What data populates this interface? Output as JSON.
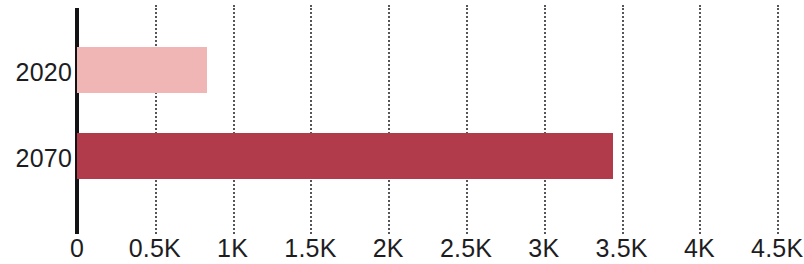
{
  "chart_data": {
    "type": "bar",
    "orientation": "horizontal",
    "title": "",
    "subtitle": "",
    "xlabel": "",
    "ylabel": "",
    "categories": [
      "2020",
      "2070"
    ],
    "values": [
      835,
      3445
    ],
    "series": [
      {
        "name": "",
        "values": [
          835,
          3445
        ],
        "colors": [
          "#f0b5b5",
          "#b23b4b"
        ]
      }
    ],
    "xlim": [
      0,
      4700
    ],
    "xticks": [
      0,
      500,
      1000,
      1500,
      2000,
      2500,
      3000,
      3500,
      4000,
      4500
    ],
    "xtick_labels": [
      "0",
      "0.5K",
      "1K",
      "1.5K",
      "2K",
      "2.5K",
      "3K",
      "3.5K",
      "4K",
      "4.5K"
    ],
    "grid": true,
    "grid_style": "dotted",
    "grid_color": "#55565a",
    "axis_color": "#131315",
    "legend": false,
    "legend_position": "none",
    "bars": [
      {
        "category": "2020",
        "value": 835,
        "color": "#f0b5b5"
      },
      {
        "category": "2070",
        "value": 3445,
        "color": "#b23b4b"
      }
    ]
  }
}
